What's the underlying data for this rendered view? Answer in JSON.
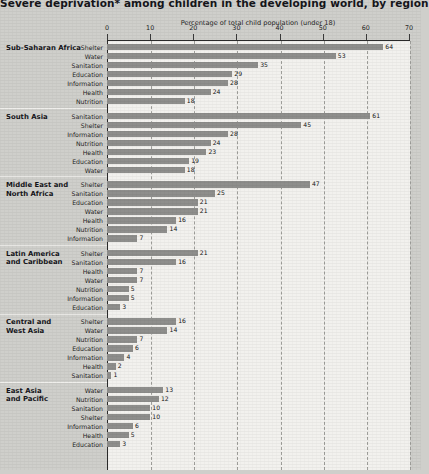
{
  "title": "Severe deprivation* among children in the developing world, by region",
  "colors": {
    "bar": "#8e8e8c",
    "page_background": "#cfcfcb",
    "plot_background": "#f2f1ee",
    "axis": "#2a2a2a",
    "gridline": "#9d9d99",
    "text": "#15151a"
  },
  "chart_data": {
    "type": "bar",
    "orientation": "horizontal",
    "title": "Severe deprivation* among children in the developing world, by region",
    "xlabel": "Percentage of total child population (under 18)",
    "ylabel": "",
    "xlim": [
      0,
      70
    ],
    "xticks": [
      0,
      10,
      20,
      30,
      40,
      50,
      60,
      70
    ],
    "grid": "vertical dashed gridlines at each tick",
    "legend": "none",
    "groups": [
      {
        "region": "Sub-Saharan Africa",
        "region_lines": [
          "Sub-Saharan Africa"
        ],
        "categories": [
          "Shelter",
          "Water",
          "Sanitation",
          "Education",
          "Information",
          "Health",
          "Nutrition"
        ],
        "values": [
          64,
          53,
          35,
          29,
          28,
          24,
          18
        ]
      },
      {
        "region": "South Asia",
        "region_lines": [
          "South Asia"
        ],
        "categories": [
          "Sanitation",
          "Shelter",
          "Information",
          "Nutrition",
          "Health",
          "Education",
          "Water"
        ],
        "values": [
          61,
          45,
          28,
          24,
          23,
          19,
          18
        ]
      },
      {
        "region": "Middle East and North Africa",
        "region_lines": [
          "Middle East and",
          "North Africa"
        ],
        "categories": [
          "Shelter",
          "Sanitation",
          "Education",
          "Water",
          "Health",
          "Nutrition",
          "Information"
        ],
        "values": [
          47,
          25,
          21,
          21,
          16,
          14,
          7
        ]
      },
      {
        "region": "Latin America and Caribbean",
        "region_lines": [
          "Latin America",
          "and Caribbean"
        ],
        "categories": [
          "Shelter",
          "Sanitation",
          "Health",
          "Water",
          "Nutrition",
          "Information",
          "Education"
        ],
        "values": [
          21,
          16,
          7,
          7,
          5,
          5,
          3
        ]
      },
      {
        "region": "Central and West Asia",
        "region_lines": [
          "Central and",
          "West Asia"
        ],
        "categories": [
          "Shelter",
          "Water",
          "Nutrition",
          "Education",
          "Information",
          "Health",
          "Sanitation"
        ],
        "values": [
          16,
          14,
          7,
          6,
          4,
          2,
          1
        ]
      },
      {
        "region": "East Asia and Pacific",
        "region_lines": [
          "East Asia",
          "and Pacific"
        ],
        "categories": [
          "Water",
          "Nutrition",
          "Sanitation",
          "Shelter",
          "Information",
          "Health",
          "Education"
        ],
        "values": [
          13,
          12,
          10,
          10,
          6,
          5,
          3
        ]
      }
    ]
  }
}
